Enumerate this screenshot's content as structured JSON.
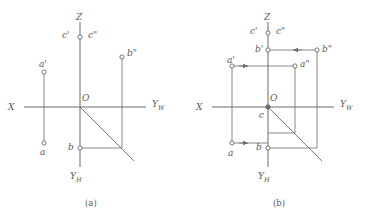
{
  "figure": {
    "stroke_color": "#6b6b6b",
    "label_color": "#5a5a5a",
    "background": "#ffffff",
    "captions": [
      {
        "id": "caption-a",
        "text": "(a)",
        "x": 85,
        "y": 199
      },
      {
        "id": "caption-b",
        "text": "(b)",
        "x": 273,
        "y": 199
      }
    ]
  },
  "diagrams": [
    {
      "id": "diagram-a",
      "caption": "(a)",
      "origin": {
        "x": 80,
        "y": 107
      },
      "axes": [
        {
          "name": "z-axis",
          "label": "Z",
          "label_x": 76,
          "label_y": 13,
          "from": [
            80,
            107
          ],
          "to": [
            80,
            22
          ]
        },
        {
          "name": "x-axis",
          "label": "X",
          "label_x": 8,
          "label_y": 103,
          "from": [
            80,
            107
          ],
          "to": [
            24,
            107
          ]
        },
        {
          "name": "yw-axis",
          "label": "Y",
          "sublabel": "W",
          "label_x": 152,
          "label_y": 100,
          "from": [
            80,
            107
          ],
          "to": [
            146,
            107
          ]
        },
        {
          "name": "yh-axis",
          "label": "Y",
          "sublabel": "H",
          "label_x": 70,
          "label_y": 172,
          "from": [
            80,
            107
          ],
          "to": [
            80,
            167
          ]
        }
      ],
      "origin_label": {
        "text": "O",
        "x": 82,
        "y": 94
      },
      "bisector": {
        "name": "bisector-45",
        "from": [
          80,
          107
        ],
        "to": [
          134,
          161
        ]
      },
      "points": [
        {
          "id": "point-a-prime",
          "label": "a'",
          "x": 44,
          "y": 72,
          "label_x": 39,
          "label_y": 60,
          "marker": "open"
        },
        {
          "id": "point-a",
          "label": "a",
          "x": 44,
          "y": 143,
          "label_x": 40,
          "label_y": 148,
          "marker": "open"
        },
        {
          "id": "point-b-double-prime",
          "label": "b\"",
          "x": 122,
          "y": 57,
          "label_x": 127,
          "label_y": 49,
          "marker": "open"
        },
        {
          "id": "point-b",
          "label": "b",
          "x": 80,
          "y": 148,
          "label_x": 68,
          "label_y": 143,
          "marker": "open"
        },
        {
          "id": "point-c-prime",
          "label": "c'",
          "x": 80,
          "y": 37,
          "label_x": 62,
          "label_y": 31,
          "marker": "open"
        },
        {
          "id": "point-c-double-prime",
          "label": "c\"",
          "x": 80,
          "y": 37,
          "label_x": 88,
          "label_y": 31,
          "marker": "none"
        }
      ],
      "projection_lines": [
        {
          "name": "aprime-a-vertical",
          "from": [
            44,
            72
          ],
          "to": [
            44,
            143
          ]
        },
        {
          "name": "bdoubleprime-vertical",
          "from": [
            122,
            57
          ],
          "to": [
            122,
            148
          ]
        },
        {
          "name": "b-horizontal",
          "from": [
            80,
            148
          ],
          "to": [
            122,
            148
          ]
        }
      ]
    },
    {
      "id": "diagram-b",
      "caption": "(b)",
      "origin": {
        "x": 268,
        "y": 107
      },
      "axes": [
        {
          "name": "z-axis",
          "label": "Z",
          "label_x": 264,
          "label_y": 13,
          "from": [
            268,
            107
          ],
          "to": [
            268,
            22
          ]
        },
        {
          "name": "x-axis",
          "label": "X",
          "label_x": 196,
          "label_y": 103,
          "from": [
            268,
            107
          ],
          "to": [
            212,
            107
          ]
        },
        {
          "name": "yw-axis",
          "label": "Y",
          "sublabel": "W",
          "label_x": 340,
          "label_y": 100,
          "from": [
            268,
            107
          ],
          "to": [
            334,
            107
          ]
        },
        {
          "name": "yh-axis",
          "label": "Y",
          "sublabel": "H",
          "label_x": 258,
          "label_y": 172,
          "from": [
            268,
            107
          ],
          "to": [
            268,
            167
          ]
        }
      ],
      "origin_label": {
        "text": "O",
        "x": 270,
        "y": 94
      },
      "bisector": {
        "name": "bisector-45",
        "from": [
          268,
          107
        ],
        "to": [
          322,
          161
        ]
      },
      "points": [
        {
          "id": "point-c-prime",
          "label": "c'",
          "x": 268,
          "y": 33,
          "label_x": 250,
          "label_y": 27,
          "marker": "open"
        },
        {
          "id": "point-c-double-prime",
          "label": "c\"",
          "x": 268,
          "y": 33,
          "label_x": 276,
          "label_y": 27,
          "marker": "none"
        },
        {
          "id": "point-c",
          "label": "c",
          "x": 268,
          "y": 107,
          "label_x": 259,
          "label_y": 111,
          "marker": "filled"
        },
        {
          "id": "point-b-prime",
          "label": "b'",
          "x": 268,
          "y": 50,
          "label_x": 255,
          "label_y": 45,
          "marker": "open"
        },
        {
          "id": "point-b-double-prime",
          "label": "b\"",
          "x": 317,
          "y": 50,
          "label_x": 322,
          "label_y": 45,
          "marker": "open"
        },
        {
          "id": "point-a-prime",
          "label": "a'",
          "x": 232,
          "y": 66,
          "label_x": 227,
          "label_y": 56,
          "marker": "open"
        },
        {
          "id": "point-a-double-prime",
          "label": "a\"",
          "x": 295,
          "y": 66,
          "label_x": 300,
          "label_y": 60,
          "marker": "open"
        },
        {
          "id": "point-a",
          "label": "a",
          "x": 232,
          "y": 143,
          "label_x": 228,
          "label_y": 149,
          "marker": "open"
        },
        {
          "id": "point-b",
          "label": "b",
          "x": 268,
          "y": 148,
          "label_x": 256,
          "label_y": 143,
          "marker": "open"
        }
      ],
      "projection_lines": [
        {
          "name": "aprime-a-vertical",
          "from": [
            232,
            66
          ],
          "to": [
            232,
            143
          ]
        },
        {
          "name": "adoubleprime-vertical",
          "from": [
            295,
            66
          ],
          "to": [
            295,
            133
          ]
        },
        {
          "name": "bdoubleprime-vertical",
          "from": [
            317,
            50
          ],
          "to": [
            317,
            148
          ]
        },
        {
          "name": "b-horizontal",
          "from": [
            268,
            148
          ],
          "to": [
            317,
            148
          ]
        },
        {
          "name": "a-horizontal",
          "from": [
            232,
            143
          ],
          "to": [
            268,
            143
          ]
        },
        {
          "name": "bprime-bdoubleprime-horizontal",
          "from": [
            268,
            50
          ],
          "to": [
            317,
            50
          ]
        },
        {
          "name": "aprime-adoubleprime-horizontal",
          "from": [
            232,
            66
          ],
          "to": [
            295,
            66
          ]
        },
        {
          "name": "adoubleprime-bottom-horizontal",
          "from": [
            268,
            133
          ],
          "to": [
            295,
            133
          ]
        }
      ],
      "arrows": [
        {
          "name": "arrow-bdoubleprime-to-bprime",
          "direction": "left",
          "x": 293,
          "y": 50
        },
        {
          "name": "arrow-aprime-to-adoubleprime",
          "direction": "right",
          "x": 248,
          "y": 66
        },
        {
          "name": "arrow-a-right",
          "direction": "right",
          "x": 248,
          "y": 143
        }
      ]
    }
  ]
}
